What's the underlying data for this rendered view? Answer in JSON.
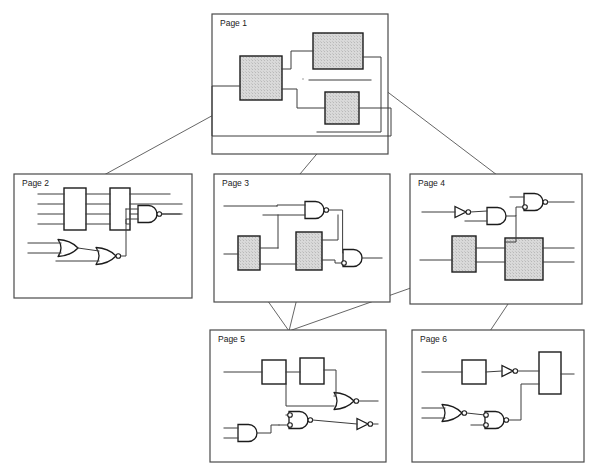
{
  "diagram": {
    "background_color": "#ffffff",
    "line_color": "#3c3c3c",
    "block_fill_gray": "#d4d4d4",
    "block_fill_white": "#ffffff",
    "page_border_color": "#4a4a4a",
    "connector_color": "#555555"
  },
  "pages": [
    {
      "id": "page1",
      "label": "Page 1",
      "x": 212,
      "y": 14,
      "w": 176,
      "h": 140,
      "label_x": 220,
      "label_y": 26,
      "blocks": [
        {
          "name": "block-a",
          "x": 240,
          "y": 56,
          "w": 42,
          "h": 44,
          "fill": "gray"
        },
        {
          "name": "block-b",
          "x": 313,
          "y": 33,
          "w": 50,
          "h": 36,
          "fill": "gray"
        },
        {
          "name": "block-c",
          "x": 325,
          "y": 92,
          "w": 34,
          "h": 32,
          "fill": "gray"
        }
      ]
    },
    {
      "id": "page2",
      "label": "Page 2",
      "x": 14,
      "y": 174,
      "w": 178,
      "h": 124,
      "label_x": 22,
      "label_y": 186,
      "blocks": [
        {
          "name": "bus-block-left",
          "x": 64,
          "y": 188,
          "w": 22,
          "h": 42,
          "fill": "white"
        },
        {
          "name": "bus-block-right",
          "x": 110,
          "y": 188,
          "w": 20,
          "h": 42,
          "fill": "white"
        }
      ],
      "gates": [
        {
          "name": "or-gate",
          "type": "or",
          "x": 58,
          "y": 240,
          "scale": 1.0
        },
        {
          "name": "nor-gate",
          "type": "nor",
          "x": 95,
          "y": 248,
          "scale": 1.0
        },
        {
          "name": "nand-gate",
          "type": "nand",
          "x": 138,
          "y": 206,
          "scale": 1.0
        }
      ]
    },
    {
      "id": "page3",
      "label": "Page 3",
      "x": 214,
      "y": 174,
      "w": 176,
      "h": 128,
      "label_x": 222,
      "label_y": 186,
      "blocks": [
        {
          "name": "block-left",
          "x": 238,
          "y": 236,
          "w": 22,
          "h": 34,
          "fill": "gray"
        },
        {
          "name": "block-mid",
          "x": 296,
          "y": 232,
          "w": 26,
          "h": 38,
          "fill": "gray"
        }
      ],
      "gates": [
        {
          "name": "nand-gate",
          "type": "nand",
          "x": 305,
          "y": 203,
          "scale": 1.0
        },
        {
          "name": "and-gate",
          "type": "and",
          "x": 343,
          "y": 250,
          "scale": 1.0
        }
      ]
    },
    {
      "id": "page4",
      "label": "Page 4",
      "x": 410,
      "y": 174,
      "w": 172,
      "h": 130,
      "label_x": 418,
      "label_y": 186,
      "blocks": [
        {
          "name": "block-left",
          "x": 452,
          "y": 236,
          "w": 24,
          "h": 36,
          "fill": "gray"
        },
        {
          "name": "block-right",
          "x": 505,
          "y": 238,
          "w": 38,
          "h": 42,
          "fill": "gray"
        }
      ],
      "gates": [
        {
          "name": "inverter-gate",
          "type": "inv",
          "x": 455,
          "y": 205,
          "scale": 1.0
        },
        {
          "name": "and-gate",
          "type": "and",
          "x": 487,
          "y": 208,
          "scale": 1.0
        },
        {
          "name": "nand-gate",
          "type": "nand",
          "x": 524,
          "y": 196,
          "scale": 1.0
        }
      ]
    },
    {
      "id": "page5",
      "label": "Page 5",
      "x": 210,
      "y": 330,
      "w": 176,
      "h": 132,
      "label_x": 218,
      "label_y": 342,
      "blocks": [
        {
          "name": "block-one",
          "x": 262,
          "y": 360,
          "w": 24,
          "h": 24,
          "fill": "white"
        },
        {
          "name": "block-two",
          "x": 300,
          "y": 358,
          "w": 24,
          "h": 26,
          "fill": "white"
        }
      ],
      "gates": [
        {
          "name": "nor-gate",
          "type": "nor",
          "x": 334,
          "y": 393,
          "scale": 1.0
        },
        {
          "name": "nand-gate",
          "type": "nand",
          "x": 289,
          "y": 412,
          "scale": 1.0
        },
        {
          "name": "and-gate",
          "type": "and",
          "x": 238,
          "y": 425,
          "scale": 1.0
        },
        {
          "name": "inverter-gate",
          "type": "inv",
          "x": 357,
          "y": 418,
          "scale": 1.0
        }
      ]
    },
    {
      "id": "page6",
      "label": "Page 6",
      "x": 412,
      "y": 330,
      "w": 172,
      "h": 132,
      "label_x": 420,
      "label_y": 342,
      "blocks": [
        {
          "name": "block-small",
          "x": 462,
          "y": 360,
          "w": 24,
          "h": 24,
          "fill": "white"
        },
        {
          "name": "block-tall",
          "x": 539,
          "y": 352,
          "w": 22,
          "h": 42,
          "fill": "white"
        }
      ],
      "gates": [
        {
          "name": "inverter-gate",
          "type": "inv",
          "x": 502,
          "y": 365,
          "scale": 1.0
        },
        {
          "name": "nor-gate",
          "type": "nor",
          "x": 442,
          "y": 405,
          "scale": 1.0
        },
        {
          "name": "nand-gate",
          "type": "nand",
          "x": 485,
          "y": 412,
          "scale": 1.0
        }
      ]
    }
  ],
  "connectors": [
    {
      "name": "connector-page1-to-page2",
      "from": "page1.block-a",
      "to": "page2",
      "x1": 248,
      "y1": 96,
      "x2": 104,
      "y2": 175
    },
    {
      "name": "connector-page1-to-page3",
      "from": "page1.block-c",
      "to": "page3",
      "x1": 342,
      "y1": 124,
      "x2": 300,
      "y2": 174
    },
    {
      "name": "connector-page1-to-page4",
      "from": "page1.block-b",
      "to": "page4",
      "x1": 356,
      "y1": 68,
      "x2": 497,
      "y2": 175
    },
    {
      "name": "connector-page3-to-page5",
      "from": "page3.block-left",
      "to": "page5",
      "x1": 246,
      "y1": 270,
      "x2": 289,
      "y2": 331
    },
    {
      "name": "connector-page3-mid-to-page5",
      "from": "page3.block-mid",
      "to": "page5",
      "x1": 304,
      "y1": 270,
      "x2": 289,
      "y2": 331
    },
    {
      "name": "connector-page4-to-page5",
      "from": "page4.block-left",
      "to": "page5",
      "x1": 456,
      "y1": 272,
      "x2": 289,
      "y2": 331
    },
    {
      "name": "connector-page4-to-page6",
      "from": "page4.block-right",
      "to": "page6",
      "x1": 524,
      "y1": 280,
      "x2": 490,
      "y2": 331
    }
  ]
}
